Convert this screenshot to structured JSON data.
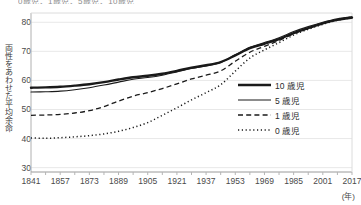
{
  "top_caption": "0歳児、1歳児、5歳児、10歳児",
  "axes": {
    "y_title": "両性をあわせた平均余命",
    "y_ticks": [
      80,
      70,
      60,
      50,
      40,
      30
    ],
    "x_ticks": [
      1841,
      1857,
      1873,
      1889,
      1905,
      1921,
      1937,
      1953,
      1969,
      1985,
      2001,
      2017
    ],
    "x_unit": "(年)"
  },
  "legend": {
    "items": [
      {
        "label": "10 歳児",
        "style": "thick-solid",
        "color": "#1a1a1a"
      },
      {
        "label": "5 歳児",
        "style": "thin-solid",
        "color": "#1a1a1a"
      },
      {
        "label": "1 歳児",
        "style": "dashed",
        "color": "#1a1a1a"
      },
      {
        "label": "0 歳児",
        "style": "dotted",
        "color": "#1a1a1a"
      }
    ]
  },
  "chart_data": {
    "type": "line",
    "title": "",
    "xlabel": "(年)",
    "ylabel": "両性をあわせた平均余命",
    "xlim": [
      1841,
      2017
    ],
    "ylim": [
      28.5,
      82.5
    ],
    "grid": "horizontal",
    "legend_position": "inside-right",
    "x": [
      1841,
      1849,
      1857,
      1865,
      1873,
      1881,
      1889,
      1897,
      1905,
      1913,
      1921,
      1929,
      1937,
      1945,
      1953,
      1961,
      1969,
      1977,
      1985,
      1993,
      2001,
      2009,
      2017
    ],
    "series": [
      {
        "name": "10 歳児",
        "style": "thick-solid",
        "values": [
          57.5,
          57.6,
          57.8,
          58.2,
          58.7,
          59.4,
          60.3,
          61.1,
          61.6,
          62.3,
          63.3,
          64.4,
          65.2,
          66.3,
          68.6,
          71.1,
          72.6,
          74.2,
          76.3,
          78.0,
          79.6,
          80.8,
          81.6
        ]
      },
      {
        "name": "5 歳児",
        "style": "thin-solid",
        "values": [
          56.0,
          56.1,
          56.3,
          56.8,
          57.5,
          58.4,
          59.4,
          60.4,
          61.0,
          61.8,
          62.9,
          64.1,
          65.0,
          66.2,
          68.8,
          71.4,
          73.0,
          74.7,
          76.8,
          78.5,
          80.0,
          81.2,
          81.9
        ]
      },
      {
        "name": "1 歳児",
        "style": "dashed",
        "values": [
          48.0,
          48.1,
          48.3,
          48.8,
          49.6,
          51.0,
          52.9,
          54.6,
          55.8,
          57.2,
          58.8,
          60.5,
          61.8,
          63.3,
          66.6,
          69.7,
          71.7,
          73.7,
          76.1,
          77.9,
          79.6,
          80.9,
          81.8
        ]
      },
      {
        "name": "0 歳児",
        "style": "dotted",
        "values": [
          40.2,
          40.1,
          40.3,
          40.6,
          41.0,
          41.6,
          42.5,
          43.8,
          45.5,
          48.0,
          50.6,
          53.3,
          55.8,
          58.5,
          63.2,
          67.7,
          70.5,
          73.0,
          75.6,
          77.6,
          79.3,
          80.7,
          81.6
        ]
      }
    ]
  }
}
